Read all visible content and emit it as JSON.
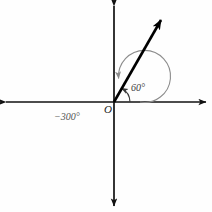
{
  "figure": {
    "background_color": "#fefefe",
    "origin": {
      "x": 114,
      "y": 102,
      "label": "O"
    },
    "axes": {
      "x_axis": {
        "y": 102,
        "x_start": 4,
        "x_end": 208,
        "color": "#111111",
        "arrow_both_ends": true
      },
      "y_axis": {
        "x": 114,
        "y_start": 4,
        "y_end": 208,
        "color": "#111111",
        "arrow_both_ends": true
      }
    },
    "ray": {
      "angle_degrees": 60,
      "length": 98,
      "color": "#000000",
      "width": 2.6,
      "tip_x": 163,
      "tip_y": 17
    },
    "angle_arcs": [
      {
        "name": "positive-60-arc",
        "label": "60°",
        "radius": 16,
        "color": "#3a3a3a",
        "direction": "counterclockwise",
        "start_degrees": 0,
        "end_degrees": 60,
        "label_x": 131,
        "label_y": 83
      },
      {
        "name": "negative-300-arc",
        "label": "−300°",
        "radius": 26,
        "color": "#8c8c8c",
        "direction": "clockwise",
        "start_degrees": 0,
        "end_degrees": -300,
        "label_x": 54,
        "label_y": 112
      }
    ]
  }
}
